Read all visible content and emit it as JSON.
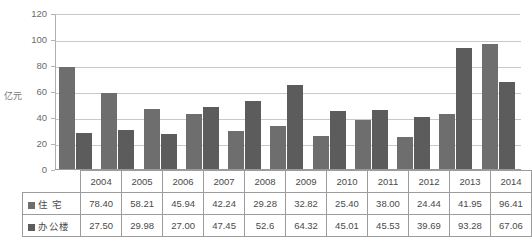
{
  "chart_data": {
    "type": "bar",
    "title": "",
    "xlabel": "",
    "ylabel": "亿元",
    "ylim": [
      0,
      120
    ],
    "yticks": [
      0,
      20,
      40,
      60,
      80,
      100,
      120
    ],
    "grid": true,
    "legend_position": "table-row-headers",
    "categories": [
      "2004",
      "2005",
      "2006",
      "2007",
      "2008",
      "2009",
      "2010",
      "2011",
      "2012",
      "2013",
      "2014"
    ],
    "series": [
      {
        "name": "住 宅",
        "color": "#6e6e6e",
        "values": [
          78.4,
          58.21,
          45.94,
          42.24,
          29.28,
          32.82,
          25.4,
          38.0,
          24.44,
          41.95,
          96.41
        ],
        "labels": [
          "78.40",
          "58.21",
          "45.94",
          "42.24",
          "29.28",
          "32.82",
          "25.40",
          "38.00",
          "24.44",
          "41.95",
          "96.41"
        ]
      },
      {
        "name": "办公楼",
        "color": "#5c5c5c",
        "values": [
          27.5,
          29.98,
          27.0,
          47.45,
          52.6,
          64.32,
          45.01,
          45.53,
          39.69,
          93.28,
          67.06
        ],
        "labels": [
          "27.50",
          "29.98",
          "27.00",
          "47.45",
          "52.6",
          "64.32",
          "45.01",
          "45.53",
          "39.69",
          "93.28",
          "67.06"
        ]
      }
    ]
  }
}
